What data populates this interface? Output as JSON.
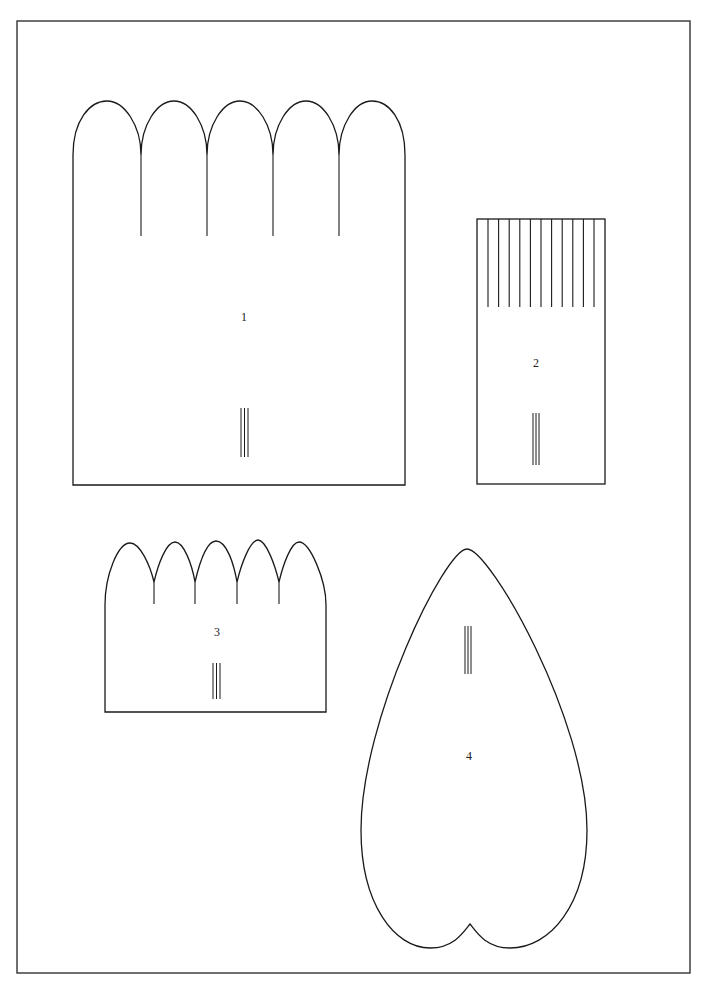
{
  "page": {
    "stroke_color": "#1a1a1a",
    "background_color": "#ffffff"
  },
  "pieces": [
    {
      "id": "piece-1",
      "label": "1",
      "shape": "rectangle with five rounded arches on top",
      "arch_count": 5,
      "slit_count": 4,
      "fold_mark_lines": 3
    },
    {
      "id": "piece-2",
      "label": "2",
      "shape": "rectangle with fringe cuts on top",
      "fringe_cut_count": 11,
      "fold_mark_lines": 3
    },
    {
      "id": "piece-3",
      "label": "3",
      "shape": "rectangle with five pointed arches on top",
      "arch_count": 5,
      "slit_count": 4,
      "fold_mark_lines": 3
    },
    {
      "id": "piece-4",
      "label": "4",
      "shape": "heart / petal shape",
      "fold_mark_lines": 3
    }
  ]
}
